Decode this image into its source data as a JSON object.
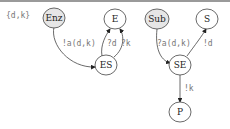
{
  "diagram": {
    "set_label": "{d,k}",
    "nodes": {
      "enz": {
        "label": "Enz",
        "fill": "#e6e6e6"
      },
      "e": {
        "label": "E",
        "fill": "#ffffff"
      },
      "es": {
        "label": "ES",
        "fill": "#ffffff"
      },
      "sub": {
        "label": "Sub",
        "fill": "#e6e6e6"
      },
      "s": {
        "label": "S",
        "fill": "#ffffff"
      },
      "se": {
        "label": "SE",
        "fill": "#ffffff"
      },
      "p": {
        "label": "P",
        "fill": "#ffffff"
      }
    },
    "edges": {
      "enz_es": {
        "from": "Enz",
        "to": "ES",
        "label": "!a(d,k)"
      },
      "es_e_d": {
        "from": "ES",
        "to": "E",
        "label": "?d"
      },
      "es_e_k": {
        "from": "ES",
        "to": "E",
        "label": "?k"
      },
      "sub_se": {
        "from": "Sub",
        "to": "SE",
        "label": "?a(d,k)"
      },
      "se_s": {
        "from": "SE",
        "to": "S",
        "label": "!d"
      },
      "se_p": {
        "from": "SE",
        "to": "P",
        "label": "!k"
      }
    }
  }
}
